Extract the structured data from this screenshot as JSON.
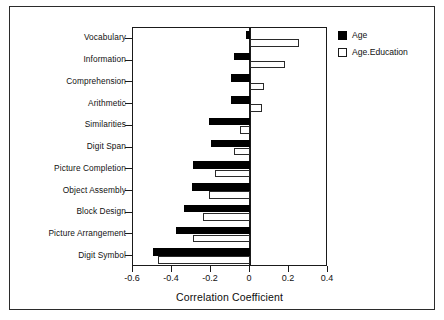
{
  "chart_data": {
    "type": "bar",
    "orientation": "horizontal",
    "title": "",
    "xlabel": "Correlation Coefficient",
    "ylabel": "",
    "xlim": [
      -0.6,
      0.4
    ],
    "xticks": [
      -0.6,
      -0.4,
      -0.2,
      0,
      0.2,
      0.4
    ],
    "xticklabels": [
      "-0.6",
      "-0.4",
      "-0.2",
      "0",
      "0.2",
      "0.4"
    ],
    "grid": false,
    "legend_position": "outside-top-right",
    "categories": [
      "Vocabulary",
      "Information",
      "Comprehension",
      "Arithmetic",
      "Similarities",
      "Digit Span",
      "Picture Completion",
      "Object Assembly",
      "Block Design",
      "Picture Arrangement",
      "Digit Symbol"
    ],
    "series": [
      {
        "name": "Age",
        "color": "#000000",
        "values": [
          -0.02,
          -0.08,
          -0.1,
          -0.1,
          -0.21,
          -0.2,
          -0.29,
          -0.3,
          -0.34,
          -0.38,
          -0.5
        ]
      },
      {
        "name": "Age.Education",
        "color": "#ffffff",
        "values": [
          0.25,
          0.18,
          0.07,
          0.06,
          -0.05,
          -0.08,
          -0.18,
          -0.21,
          -0.24,
          -0.29,
          -0.47
        ]
      }
    ]
  },
  "legend": {
    "entries": [
      {
        "label": "Age",
        "swatch": "filled-black-square"
      },
      {
        "label": "Age.Education",
        "swatch": "open-white-square"
      }
    ]
  }
}
